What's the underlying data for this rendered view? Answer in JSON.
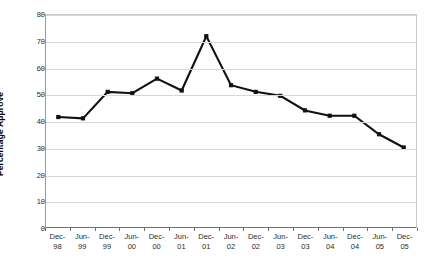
{
  "chart_data": {
    "type": "line",
    "title": "",
    "xlabel": "",
    "ylabel": "Percentage Approve",
    "ylim": [
      0,
      80
    ],
    "ytick_step": 10,
    "yticks": [
      0,
      10,
      20,
      30,
      40,
      50,
      60,
      70,
      80
    ],
    "grid": true,
    "legend": false,
    "categories": [
      "Dec-98",
      "Jun-99",
      "Dec-99",
      "Jun-00",
      "Dec-00",
      "Jun-01",
      "Dec-01",
      "Jun-02",
      "Dec-02",
      "Jun-03",
      "Dec-03",
      "Jun-04",
      "Dec-04",
      "Jun-05",
      "Dec-05"
    ],
    "category_lines": [
      [
        "Dec-",
        "98"
      ],
      [
        "Jun-",
        "99"
      ],
      [
        "Dec-",
        "99"
      ],
      [
        "Jun-",
        "00"
      ],
      [
        "Dec-",
        "00"
      ],
      [
        "Jun-",
        "01"
      ],
      [
        "Dec-",
        "01"
      ],
      [
        "Jun-",
        "02"
      ],
      [
        "Dec-",
        "02"
      ],
      [
        "Jun-",
        "03"
      ],
      [
        "Dec-",
        "03"
      ],
      [
        "Jun-",
        "04"
      ],
      [
        "Dec-",
        "04"
      ],
      [
        "Jun-",
        "05"
      ],
      [
        "Dec-",
        "05"
      ]
    ],
    "values": [
      41.5,
      41,
      51,
      50.5,
      56,
      51.5,
      72,
      53.5,
      51,
      49.5,
      44,
      42,
      42,
      35,
      30
    ],
    "series_color": "#111111",
    "grid_color": "#d7d7d7",
    "axis_color": "#6e6e6e",
    "background": "#ffffff"
  }
}
